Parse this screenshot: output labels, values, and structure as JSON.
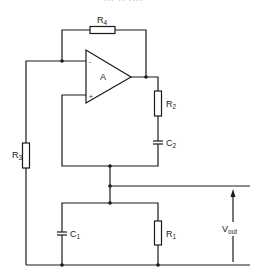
{
  "header": {
    "clipped_text": "··· ·· ····"
  },
  "diagram": {
    "opamp": {
      "label": "A",
      "minus": "-",
      "plus": "+"
    },
    "components": {
      "R4": {
        "letter": "R",
        "sub": "4"
      },
      "R3": {
        "letter": "R",
        "sub": "3"
      },
      "R2": {
        "letter": "R",
        "sub": "2"
      },
      "C2": {
        "letter": "C",
        "sub": "2"
      },
      "C1": {
        "letter": "C",
        "sub": "1"
      },
      "R1": {
        "letter": "R",
        "sub": "1"
      }
    },
    "output": {
      "letter": "V",
      "sub": "out"
    }
  },
  "colors": {
    "ink": "#1a1a1a",
    "background": "#ffffff"
  }
}
